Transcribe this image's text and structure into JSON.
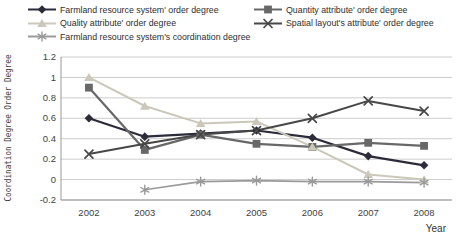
{
  "chart_data": {
    "type": "line",
    "title": "",
    "x_axis_label": "Year",
    "y_axis_label": "Coordination Degree Order Degree",
    "categories": [
      "2002",
      "2003",
      "2004",
      "2005",
      "2006",
      "2007",
      "2008"
    ],
    "ylim": [
      -0.2,
      1.2
    ],
    "y_ticks": [
      -0.2,
      0,
      0.2,
      0.4,
      0.6,
      0.8,
      1,
      1.2
    ],
    "grid": true,
    "legend_position": "top-left",
    "series": [
      {
        "name": "Farmland resource system' order degree",
        "marker": "diamond",
        "color": "#2b2b3a",
        "stroke_width": 2.2,
        "values": [
          0.6,
          0.42,
          0.45,
          0.48,
          0.41,
          0.23,
          0.14
        ]
      },
      {
        "name": "Quantity attribute' order degree",
        "marker": "square",
        "color": "#686868",
        "stroke_width": 2.2,
        "values": [
          0.9,
          0.29,
          0.44,
          0.35,
          0.32,
          0.36,
          0.33
        ]
      },
      {
        "name": "Quality attribute' order degree",
        "marker": "triangle",
        "color": "#cbc8ba",
        "stroke_width": 2,
        "values": [
          1.0,
          0.72,
          0.55,
          0.57,
          0.32,
          0.05,
          0.0
        ]
      },
      {
        "name": "Spatial layout's attribute' order degree",
        "marker": "x",
        "color": "#474747",
        "stroke_width": 2,
        "values": [
          0.25,
          0.35,
          0.44,
          0.48,
          0.6,
          0.77,
          0.67
        ]
      },
      {
        "name": "Farmland resource system's coordination degree",
        "marker": "asterisk",
        "color": "#9a9a9a",
        "stroke_width": 1.6,
        "values": [
          null,
          -0.1,
          -0.02,
          -0.01,
          -0.02,
          -0.02,
          -0.03
        ]
      }
    ]
  }
}
